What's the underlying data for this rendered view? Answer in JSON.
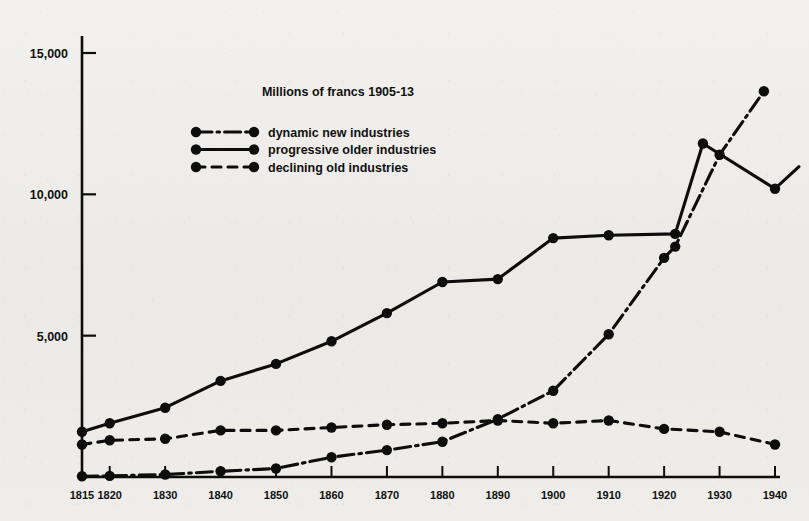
{
  "chart_data": {
    "type": "line",
    "title": "Millions of francs 1905-13",
    "xlabel": "",
    "ylabel": "",
    "xlim": [
      1815,
      1940
    ],
    "ylim": [
      0,
      15500
    ],
    "grid": false,
    "legend_position": "upper-center",
    "x_ticks": [
      1815,
      1820,
      1830,
      1840,
      1850,
      1860,
      1870,
      1880,
      1890,
      1900,
      1910,
      1920,
      1930,
      1940
    ],
    "x_tick_labels": [
      "1815",
      "1820",
      "1830",
      "1840",
      "1850",
      "1860",
      "1870",
      "1880",
      "1890",
      "1900",
      "1910",
      "1920",
      "1930",
      "1940"
    ],
    "y_ticks": [
      5000,
      10000,
      15000
    ],
    "y_tick_labels": [
      "5,000",
      "10,000",
      "15,000"
    ],
    "series": [
      {
        "name": "dynamic new industries",
        "style": "dash-dot",
        "x": [
          1815,
          1820,
          1830,
          1840,
          1850,
          1860,
          1870,
          1880,
          1890,
          1900,
          1910,
          1920,
          1922,
          1930,
          1938
        ],
        "values": [
          30,
          40,
          90,
          200,
          300,
          700,
          950,
          1250,
          2050,
          3050,
          5050,
          7750,
          8150,
          11400,
          13650
        ]
      },
      {
        "name": "progressive older industries",
        "style": "solid",
        "x": [
          1815,
          1820,
          1830,
          1840,
          1850,
          1860,
          1870,
          1880,
          1890,
          1900,
          1910,
          1922,
          1927,
          1940
        ],
        "values": [
          1600,
          1900,
          2450,
          3400,
          4000,
          4800,
          5800,
          6900,
          7000,
          8450,
          8550,
          8600,
          11800,
          10200
        ]
      },
      {
        "name": "declining old industries",
        "style": "dashed",
        "x": [
          1815,
          1820,
          1830,
          1840,
          1850,
          1860,
          1870,
          1880,
          1890,
          1900,
          1910,
          1920,
          1930,
          1940
        ],
        "values": [
          1150,
          1300,
          1350,
          1650,
          1650,
          1750,
          1850,
          1900,
          2000,
          1900,
          2000,
          1700,
          1600,
          1150
        ]
      }
    ]
  },
  "legend": {
    "entries": [
      {
        "label": "dynamic new industries",
        "style": "dash-dot"
      },
      {
        "label": "progressive older industries",
        "style": "solid"
      },
      {
        "label": "declining old industries",
        "style": "dashed"
      }
    ]
  },
  "colors": {
    "ink": "#0d0d0d",
    "paper": "#efeeec"
  }
}
